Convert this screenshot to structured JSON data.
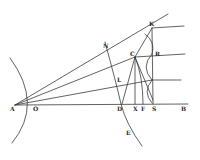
{
  "figure": {
    "type": "geometric-construction",
    "stroke_color": "#3a3a3a",
    "background": "#ffffff"
  },
  "points": {
    "A": {
      "label": "A",
      "x": 15,
      "y": 105
    },
    "O": {
      "label": "O",
      "x": 31,
      "y": 104
    },
    "N": {
      "label": "N",
      "x": 107,
      "y": 48
    },
    "L": {
      "label": "L",
      "x": 119,
      "y": 81
    },
    "C": {
      "label": "C",
      "x": 135,
      "y": 57
    },
    "K": {
      "label": "K",
      "x": 152,
      "y": 28
    },
    "R": {
      "label": "R",
      "x": 152,
      "y": 54
    },
    "D": {
      "label": "D",
      "x": 121,
      "y": 104
    },
    "X": {
      "label": "X",
      "x": 135,
      "y": 104
    },
    "F": {
      "label": "F",
      "x": 143,
      "y": 104
    },
    "S": {
      "label": "S",
      "x": 153,
      "y": 104
    },
    "B": {
      "label": "B",
      "x": 182,
      "y": 104
    },
    "E": {
      "label": "E",
      "x": 128,
      "y": 134
    }
  },
  "labels": [
    {
      "id": "A",
      "text": "A",
      "x": 10,
      "y": 106
    },
    {
      "id": "O",
      "text": "O",
      "x": 33,
      "y": 106
    },
    {
      "id": "N",
      "text": "N",
      "x": 103,
      "y": 43
    },
    {
      "id": "L",
      "text": "L",
      "x": 117,
      "y": 78
    },
    {
      "id": "C",
      "text": "C",
      "x": 131,
      "y": 51
    },
    {
      "id": "K",
      "text": "K",
      "x": 150,
      "y": 22
    },
    {
      "id": "R",
      "text": "R",
      "x": 154,
      "y": 52
    },
    {
      "id": "D",
      "text": "D",
      "x": 117,
      "y": 106
    },
    {
      "id": "X",
      "text": "X",
      "x": 133,
      "y": 106
    },
    {
      "id": "F",
      "text": "F",
      "x": 141,
      "y": 106
    },
    {
      "id": "S",
      "text": "S",
      "x": 152,
      "y": 106
    },
    {
      "id": "B",
      "text": "B",
      "x": 181,
      "y": 106
    },
    {
      "id": "E",
      "text": "E",
      "x": 126,
      "y": 131
    }
  ]
}
